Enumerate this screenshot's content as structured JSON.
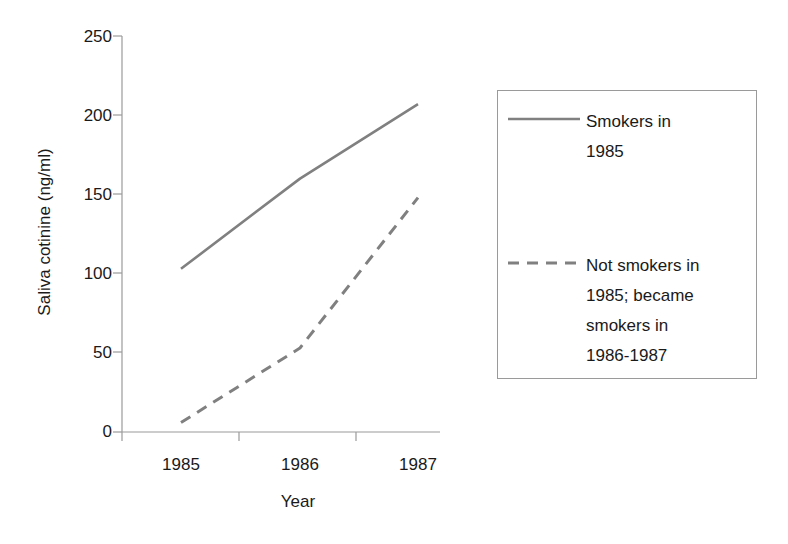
{
  "chart_data": {
    "type": "line",
    "title": "",
    "xlabel": "Year",
    "ylabel": "Saliva cotinine (ng/ml)",
    "categories": [
      "1985",
      "1986",
      "1987"
    ],
    "x_tick_labels": [
      "1985",
      "1986",
      "1987"
    ],
    "y_tick_labels": [
      "0",
      "50",
      "100",
      "150",
      "200",
      "250"
    ],
    "y_ticks": [
      0,
      50,
      100,
      150,
      200,
      250
    ],
    "ylim": [
      0,
      250
    ],
    "grid": false,
    "legend_position": "right",
    "series": [
      {
        "name": "Smokers in 1985",
        "style": "solid",
        "color": "#808080",
        "values": [
          103,
          160,
          207
        ]
      },
      {
        "name": "Not smokers in 1985; became smokers in 1986-1987",
        "style": "dashed",
        "color": "#808080",
        "values": [
          6,
          53,
          148
        ]
      }
    ]
  },
  "axes": {
    "y_title": "Saliva cotinine (ng/ml)",
    "x_title": "Year",
    "y_labels": [
      "250",
      "200",
      "150",
      "100",
      "50",
      "0"
    ],
    "x_labels": [
      "1985",
      "1986",
      "1987"
    ],
    "axis_color": "#9a9a9a"
  },
  "legend": {
    "entries": [
      {
        "style": "solid",
        "lines": [
          "Smokers in",
          "1985"
        ]
      },
      {
        "style": "dashed",
        "lines": [
          "Not smokers in",
          "1985; became",
          "smokers in",
          "1986-1987"
        ]
      }
    ],
    "border_color": "#9a9a9a"
  },
  "colors": {
    "line": "#808080",
    "text": "#1a1a1a",
    "axis": "#9a9a9a",
    "background": "#ffffff"
  }
}
